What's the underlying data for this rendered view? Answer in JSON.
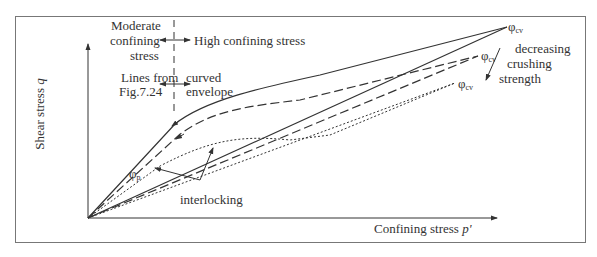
{
  "figure": {
    "y_axis_label": "Shear stress",
    "y_axis_var": "q",
    "x_axis_label": "Confining stress",
    "x_axis_var": "p'",
    "region_labels": {
      "moderate_line1": "Moderate",
      "moderate_line2": "confining",
      "moderate_line3": "stress",
      "high": "High confining stress",
      "lines_from_line1": "Lines from",
      "lines_from_line2": "Fig.7.24",
      "curved_line1": "curved",
      "curved_line2": "envelope"
    },
    "annotations": {
      "phi_symbol": "φ",
      "phi_p_sub": "p",
      "phi_cv_sub": "cv",
      "decreasing_line1": "decreasing",
      "decreasing_line2": "crushing",
      "decreasing_line3": "strength",
      "interlocking": "interlocking"
    },
    "colors": {
      "line": "#333333",
      "frame": "#777777"
    }
  }
}
